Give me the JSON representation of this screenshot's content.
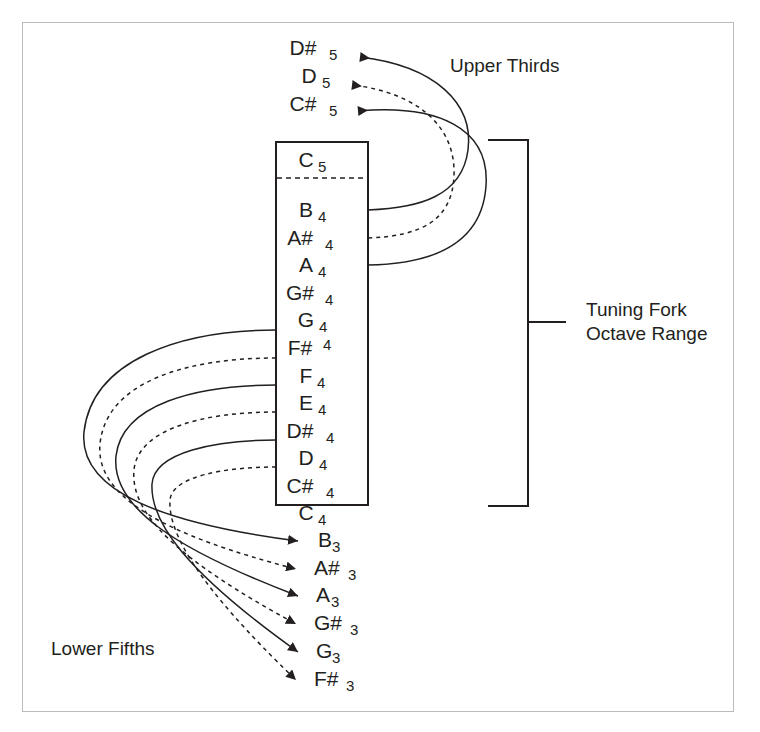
{
  "figure": {
    "background_color": "#ffffff",
    "ink_color": "#231f20",
    "frame_color": "#b9bcbe"
  },
  "captions": {
    "upper": "Upper Thirds",
    "lower": "Lower Fifths",
    "bracket_line1": "Tuning Fork",
    "bracket_line2": "Octave Range"
  },
  "octave_box": {
    "x": 276,
    "y": 142,
    "width": 92,
    "height": 363,
    "divider_y": 178,
    "notes": [
      {
        "name": "C",
        "accidental": "",
        "octave": "5",
        "y": 167,
        "sub_raised": false
      },
      {
        "name": "B",
        "accidental": "",
        "octave": "4",
        "y": 217,
        "sub_raised": false
      },
      {
        "name": "A",
        "accidental": "#",
        "octave": "4",
        "y": 245,
        "sub_raised": false
      },
      {
        "name": "A",
        "accidental": "",
        "octave": "4",
        "y": 272,
        "sub_raised": false
      },
      {
        "name": "G",
        "accidental": "#",
        "octave": "4",
        "y": 300,
        "sub_raised": false
      },
      {
        "name": "G",
        "accidental": "",
        "octave": "4",
        "y": 327,
        "sub_raised": false
      },
      {
        "name": "F",
        "accidental": "#",
        "octave": "4",
        "y": 355,
        "sub_raised": true
      },
      {
        "name": "F",
        "accidental": "",
        "octave": "4",
        "y": 383,
        "sub_raised": false
      },
      {
        "name": "E",
        "accidental": "",
        "octave": "4",
        "y": 410,
        "sub_raised": false
      },
      {
        "name": "D",
        "accidental": "#",
        "octave": "4",
        "y": 438,
        "sub_raised": false
      },
      {
        "name": "D",
        "accidental": "",
        "octave": "4",
        "y": 465,
        "sub_raised": false
      },
      {
        "name": "C",
        "accidental": "#",
        "octave": "4",
        "y": 493,
        "sub_raised": false
      },
      {
        "name": "C",
        "accidental": "",
        "octave": "4",
        "y": 520,
        "sub_raised": false
      }
    ]
  },
  "upper_thirds": {
    "targets": [
      {
        "name": "D",
        "accidental": "#",
        "octave": "5",
        "y": 55
      },
      {
        "name": "D",
        "accidental": "",
        "octave": "5",
        "y": 83
      },
      {
        "name": "C",
        "accidental": "#",
        "octave": "5",
        "y": 111
      }
    ],
    "connections": [
      {
        "from": "B4",
        "to": "D#5",
        "style": "solid"
      },
      {
        "from": "A#4",
        "to": "D5",
        "style": "dashed"
      },
      {
        "from": "A4",
        "to": "C#5",
        "style": "solid"
      }
    ]
  },
  "lower_fifths": {
    "targets": [
      {
        "name": "B",
        "accidental": "",
        "octave": "3",
        "y": 547
      },
      {
        "name": "A",
        "accidental": "#",
        "octave": "3",
        "y": 575
      },
      {
        "name": "A",
        "accidental": "",
        "octave": "3",
        "y": 602
      },
      {
        "name": "G",
        "accidental": "#",
        "octave": "3",
        "y": 630
      },
      {
        "name": "G",
        "accidental": "",
        "octave": "3",
        "y": 658
      },
      {
        "name": "F",
        "accidental": "#",
        "octave": "3",
        "y": 686
      }
    ],
    "connections": [
      {
        "from": "F#4",
        "to": "B3",
        "style": "solid"
      },
      {
        "from": "F4",
        "to": "A#3",
        "style": "dashed"
      },
      {
        "from": "E4",
        "to": "A3",
        "style": "solid"
      },
      {
        "from": "D#4",
        "to": "G#3",
        "style": "dashed"
      },
      {
        "from": "D4",
        "to": "G3",
        "style": "solid"
      },
      {
        "from": "C#4",
        "to": "F#3",
        "style": "dashed"
      }
    ]
  },
  "range_bracket": {
    "x": 528,
    "top_y": 140,
    "bottom_y": 506,
    "arm_length": 40,
    "tick_y": 322,
    "tick_length": 38
  }
}
